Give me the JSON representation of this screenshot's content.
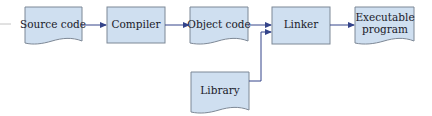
{
  "diagram": {
    "colors": {
      "box_fill": "#cfdff0",
      "box_stroke": "#7d8896",
      "arrow": "#34448a",
      "stub_line": "#bfbfbf"
    },
    "nodes": [
      {
        "id": "source-code",
        "shape": "document",
        "lines": [
          "Source code"
        ]
      },
      {
        "id": "compiler",
        "shape": "process",
        "lines": [
          "Compiler"
        ]
      },
      {
        "id": "object-code",
        "shape": "document",
        "lines": [
          "Object code"
        ]
      },
      {
        "id": "linker",
        "shape": "process",
        "lines": [
          "Linker"
        ]
      },
      {
        "id": "executable-program",
        "shape": "document",
        "lines": [
          "Executable",
          "program"
        ]
      },
      {
        "id": "library",
        "shape": "document",
        "lines": [
          "Library"
        ]
      }
    ],
    "edges": [
      {
        "from": "source-code",
        "to": "compiler"
      },
      {
        "from": "compiler",
        "to": "object-code"
      },
      {
        "from": "object-code",
        "to": "linker"
      },
      {
        "from": "library",
        "to": "linker"
      },
      {
        "from": "linker",
        "to": "executable-program"
      }
    ]
  }
}
